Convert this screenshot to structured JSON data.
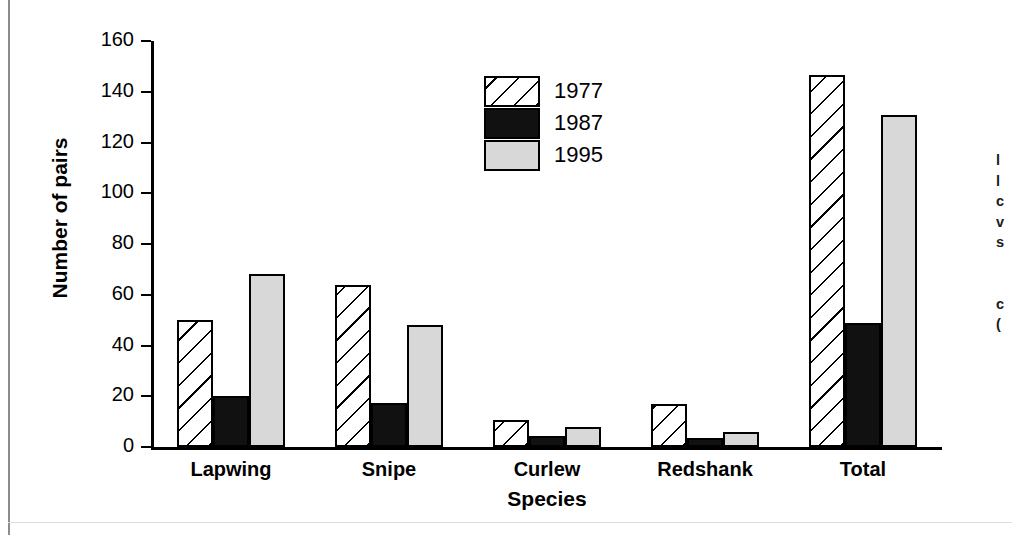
{
  "chart_data": {
    "type": "bar",
    "title": "",
    "xlabel": "Species",
    "ylabel": "Number of pairs",
    "categories": [
      "Lapwing",
      "Snipe",
      "Curlew",
      "Redshank",
      "Total"
    ],
    "series": [
      {
        "name": "1977",
        "values": [
          50,
          64,
          10.5,
          17,
          146.5
        ],
        "fill": "diagonal-hatch",
        "color": "#ffffff"
      },
      {
        "name": "1987",
        "values": [
          20,
          17.5,
          4.5,
          3.5,
          49
        ],
        "fill": "solid",
        "color": "#111111"
      },
      {
        "name": "1995",
        "values": [
          68,
          48,
          8,
          6,
          131
        ],
        "fill": "solid",
        "color": "#d8d8d8"
      }
    ],
    "ylim": [
      0,
      160
    ],
    "yticks": [
      0,
      20,
      40,
      60,
      80,
      100,
      120,
      140,
      160
    ],
    "ytick_labels": [
      "0",
      "20",
      "40",
      "60",
      "80",
      "100",
      "120",
      "140",
      "160"
    ],
    "grid": false,
    "legend_position": "upper-center",
    "legend_entries": [
      "1977",
      "1987",
      "1995"
    ]
  },
  "margin": {
    "right_text_fragments": "l\nl\nc\nv\ns\n \n \nc\n("
  }
}
